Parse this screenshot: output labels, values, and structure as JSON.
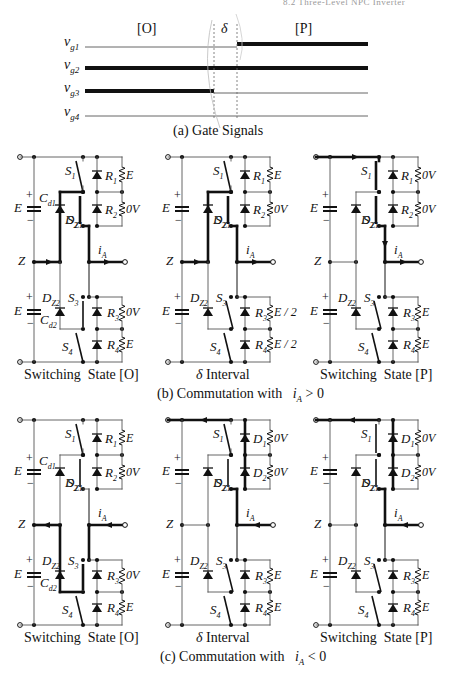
{
  "page_header": "8.2  Three-Level NPC Inverter",
  "gate_signals": {
    "segments": {
      "left": "[O]",
      "middle": "δ",
      "right": "[P]"
    },
    "signals": [
      {
        "name": "v_g1",
        "symbol": "v",
        "sub": "g1",
        "low_until": "delta_end",
        "state": "low-then-high"
      },
      {
        "name": "v_g2",
        "symbol": "v",
        "sub": "g2",
        "state": "high"
      },
      {
        "name": "v_g3",
        "symbol": "v",
        "sub": "g3",
        "state": "high-then-low"
      },
      {
        "name": "v_g4",
        "symbol": "v",
        "sub": "g4",
        "state": "low"
      }
    ],
    "caption": "(a) Gate Signals"
  },
  "row_b": {
    "caption_prefix": "(b) Commutation with",
    "caption_condition": "i",
    "caption_sub": "A",
    "caption_op": " > 0",
    "panels": [
      {
        "title": "Switching  State [O]",
        "title_prefix": "",
        "v_top1": "E",
        "v_top2": "0V",
        "v_bot1": "0V",
        "v_bot2": "E",
        "top1_label": "R",
        "top1_sub": "1",
        "top2_label": "R",
        "top2_sub": "2",
        "bot1_label": "R",
        "bot1_sub": "3",
        "bot2_label": "R",
        "bot2_sub": "4",
        "cap_top": "C",
        "cap_top_sub": "d1",
        "cap_bot": "C",
        "cap_bot_sub": "d2"
      },
      {
        "title": " Interval",
        "title_prefix": "δ",
        "v_top1": "E",
        "v_top2": "0V",
        "v_bot1": "E / 2",
        "v_bot2": "E / 2",
        "top1_label": "R",
        "top1_sub": "1",
        "top2_label": "R",
        "top2_sub": "2",
        "bot1_label": "R",
        "bot1_sub": "3",
        "bot2_label": "R",
        "bot2_sub": "4"
      },
      {
        "title": "Switching  State [P]",
        "title_prefix": "",
        "v_top1": "0V",
        "v_top2": "0V",
        "v_bot1": "E",
        "v_bot2": "E",
        "top1_label": "R",
        "top1_sub": "1",
        "top2_label": "R",
        "top2_sub": "2",
        "bot1_label": "R",
        "bot1_sub": "3",
        "bot2_label": "R",
        "bot2_sub": "4"
      }
    ]
  },
  "row_c": {
    "caption_prefix": "(c) Commutation with",
    "caption_condition": "i",
    "caption_sub": "A",
    "caption_op": " < 0",
    "panels": [
      {
        "title": "Switching  State [O]",
        "title_prefix": "",
        "v_top1": "E",
        "v_top2": "0V",
        "v_bot1": "0V",
        "v_bot2": "E",
        "top1_label": "R",
        "top1_sub": "1",
        "top2_label": "R",
        "top2_sub": "2",
        "bot1_label": "R",
        "bot1_sub": "3",
        "bot2_label": "R",
        "bot2_sub": "4",
        "cap_top": "C",
        "cap_top_sub": "d1",
        "cap_bot": "C",
        "cap_bot_sub": "d2"
      },
      {
        "title": " Interval",
        "title_prefix": "δ",
        "v_top1": "0V",
        "v_top2": "0V",
        "v_bot1": "E",
        "v_bot2": "E",
        "top1_label": "D",
        "top1_sub": "1",
        "top2_label": "D",
        "top2_sub": "2",
        "bot1_label": "R",
        "bot1_sub": "3",
        "bot2_label": "R",
        "bot2_sub": "4"
      },
      {
        "title": "Switching  State [P]",
        "title_prefix": "",
        "v_top1": "0V",
        "v_top2": "0V",
        "v_bot1": "E",
        "v_bot2": "E",
        "top1_label": "D",
        "top1_sub": "1",
        "top2_label": "D",
        "top2_sub": "2",
        "bot1_label": "R",
        "bot1_sub": "3",
        "bot2_label": "R",
        "bot2_sub": "4"
      }
    ]
  },
  "common_labels": {
    "dc_source": "E",
    "neutral": "Z",
    "s1": "S",
    "s1_sub": "1",
    "s2": "S",
    "s2_sub": "2",
    "s3": "S",
    "s3_sub": "3",
    "s4": "S",
    "s4_sub": "4",
    "dz1": "D",
    "dz1_sub": "Z1",
    "dz2": "D",
    "dz2_sub": "Z2",
    "current": "i",
    "current_sub": "A",
    "plus": "+",
    "minus": "−"
  },
  "colors": {
    "ink": "#111111",
    "thin_wire": "#555555",
    "dashed": "#666666"
  }
}
